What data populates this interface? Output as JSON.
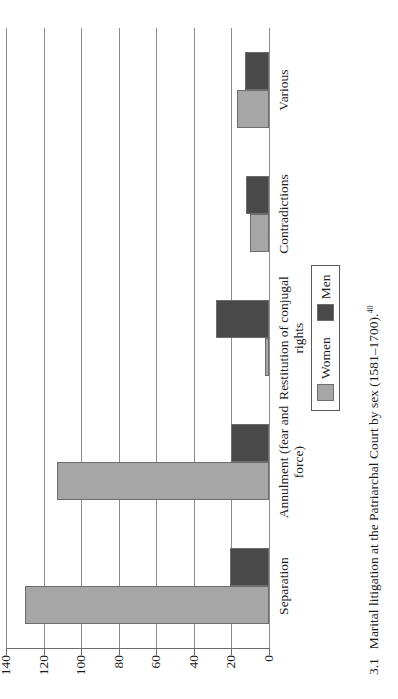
{
  "figure": {
    "number": "3.1",
    "caption": "Marital litigation at the Patriarchal Court by sex (1581–1700).",
    "footnote_marker": "40"
  },
  "legend": {
    "position": "inside-bottom-right",
    "entries": [
      {
        "label": "Women",
        "color": "#a6a6a6"
      },
      {
        "label": "Men",
        "color": "#494949"
      }
    ]
  },
  "axis": {
    "tick_labels": [
      "0",
      "20",
      "40",
      "60",
      "80",
      "100",
      "120",
      "140"
    ],
    "min": 0,
    "max": 140,
    "step": 20
  },
  "chart_data": {
    "type": "bar",
    "orientation": "vertical-rotated",
    "title": "",
    "xlabel": "",
    "ylabel": "",
    "ylim": [
      0,
      140
    ],
    "grid": true,
    "legend_position": "bottom-right",
    "categories": [
      "Separation",
      "Annulment (fear and force)",
      "Restitution of conjugal rights",
      "Contradictions",
      "Various"
    ],
    "series": [
      {
        "name": "Women",
        "color": "#a6a6a6",
        "values": [
          130,
          113,
          2,
          10,
          17
        ]
      },
      {
        "name": "Men",
        "color": "#494949",
        "values": [
          21,
          20,
          28,
          12,
          13
        ]
      }
    ]
  }
}
